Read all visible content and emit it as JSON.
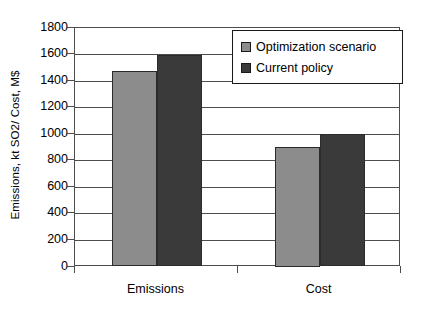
{
  "chart_data": {
    "type": "bar",
    "title": "",
    "subtitle": "",
    "xlabel": "",
    "ylabel": "Emissions, kt SO2/ Cost, M$",
    "categories": [
      "Emissions",
      "Cost"
    ],
    "series": [
      {
        "name": "Optimization scenario",
        "values": [
          1470,
          900
        ],
        "color": "#8c8c8c"
      },
      {
        "name": "Current policy",
        "values": [
          1590,
          1000
        ],
        "color": "#3a3a3a"
      }
    ],
    "ylim": [
      0,
      1800
    ],
    "ytick_step": 200,
    "yticks": [
      0,
      200,
      400,
      600,
      800,
      1000,
      1200,
      1400,
      1600,
      1800
    ],
    "ytick_labels": [
      "0",
      "200",
      "400",
      "600",
      "800",
      "1000",
      "1200",
      "1400",
      "1600",
      "1800"
    ],
    "grid": "horizontal",
    "legend_position": "top-right",
    "frame_color": "#4d4d4d",
    "bar_edge_color": "#2b2b2b"
  },
  "legend": {
    "items": [
      {
        "label": "Optimization scenario",
        "color": "#8c8c8c"
      },
      {
        "label": "Current policy",
        "color": "#3a3a3a"
      }
    ]
  }
}
